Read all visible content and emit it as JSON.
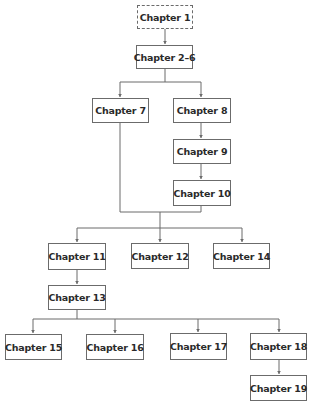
{
  "diagram": {
    "type": "flowchart",
    "colors": {
      "border": "#6b6b6b",
      "text": "#2a2a2a",
      "edge": "#6b6b6b",
      "background": "#ffffff"
    },
    "nodes": [
      {
        "id": "ch1",
        "label": "Chapter 1",
        "style": "dashed",
        "x": 137,
        "y": 5,
        "w": 56,
        "h": 24
      },
      {
        "id": "ch2_6",
        "label": "Chapter 2–6",
        "style": "solid",
        "x": 136,
        "y": 45,
        "w": 57,
        "h": 24
      },
      {
        "id": "ch7",
        "label": "Chapter 7",
        "style": "solid",
        "x": 92,
        "y": 98,
        "w": 57,
        "h": 25
      },
      {
        "id": "ch8",
        "label": "Chapter 8",
        "style": "solid",
        "x": 173,
        "y": 98,
        "w": 58,
        "h": 25
      },
      {
        "id": "ch9",
        "label": "Chapter 9",
        "style": "solid",
        "x": 173,
        "y": 139,
        "w": 58,
        "h": 25
      },
      {
        "id": "ch10",
        "label": "Chapter 10",
        "style": "solid",
        "x": 173,
        "y": 180,
        "w": 58,
        "h": 26
      },
      {
        "id": "ch11",
        "label": "Chapter 11",
        "style": "solid",
        "x": 48,
        "y": 243,
        "w": 58,
        "h": 27
      },
      {
        "id": "ch12",
        "label": "Chapter 12",
        "style": "solid",
        "x": 131,
        "y": 243,
        "w": 58,
        "h": 26
      },
      {
        "id": "ch14",
        "label": "Chapter 14",
        "style": "solid",
        "x": 213,
        "y": 243,
        "w": 57,
        "h": 26
      },
      {
        "id": "ch13",
        "label": "Chapter 13",
        "style": "solid",
        "x": 48,
        "y": 285,
        "w": 58,
        "h": 25
      },
      {
        "id": "ch15",
        "label": "Chapter 15",
        "style": "solid",
        "x": 5,
        "y": 334,
        "w": 57,
        "h": 26
      },
      {
        "id": "ch16",
        "label": "Chapter 16",
        "style": "solid",
        "x": 86,
        "y": 334,
        "w": 58,
        "h": 26
      },
      {
        "id": "ch17",
        "label": "Chapter 17",
        "style": "solid",
        "x": 170,
        "y": 333,
        "w": 57,
        "h": 27
      },
      {
        "id": "ch18",
        "label": "Chapter 18",
        "style": "solid",
        "x": 250,
        "y": 333,
        "w": 57,
        "h": 27
      },
      {
        "id": "ch19",
        "label": "Chapter 19",
        "style": "solid",
        "x": 250,
        "y": 375,
        "w": 57,
        "h": 26
      }
    ],
    "edges": [
      {
        "from": "ch1",
        "to": "ch2_6"
      },
      {
        "from": "ch2_6",
        "to": "ch7"
      },
      {
        "from": "ch2_6",
        "to": "ch8"
      },
      {
        "from": "ch8",
        "to": "ch9"
      },
      {
        "from": "ch9",
        "to": "ch10"
      },
      {
        "from": "ch7",
        "to": "ch11"
      },
      {
        "from": "ch7",
        "to": "ch12"
      },
      {
        "from": "ch7",
        "to": "ch14"
      },
      {
        "from": "ch10",
        "to": "ch11"
      },
      {
        "from": "ch10",
        "to": "ch12"
      },
      {
        "from": "ch10",
        "to": "ch14"
      },
      {
        "from": "ch11",
        "to": "ch13"
      },
      {
        "from": "ch13",
        "to": "ch15"
      },
      {
        "from": "ch13",
        "to": "ch16"
      },
      {
        "from": "ch13",
        "to": "ch17"
      },
      {
        "from": "ch13",
        "to": "ch18"
      },
      {
        "from": "ch18",
        "to": "ch19"
      }
    ],
    "paths": [
      "M165 29 L165 44",
      "M165 69 L165 82 M120 82 L201 82 M120 82 L120 97 M201 82 L201 97",
      "M201 123 L201 138",
      "M201 164 L201 179",
      "M120 123 L120 212 L201 212 L201 206",
      "M160 212 L160 228 M77 228 L242 228 M77 228 L77 242 M160 228 L160 242 M242 228 L242 242",
      "M77 270 L77 284",
      "M77 310 L77 319 M33 319 L279 319 M33 319 L33 333 M115 319 L115 333 M198 319 L198 332 M279 319 L279 332",
      "M279 360 L279 374"
    ],
    "arrowheads": [
      [
        165,
        44
      ],
      [
        120,
        97
      ],
      [
        201,
        97
      ],
      [
        201,
        138
      ],
      [
        201,
        179
      ],
      [
        77,
        242
      ],
      [
        160,
        242
      ],
      [
        242,
        242
      ],
      [
        77,
        284
      ],
      [
        33,
        333
      ],
      [
        115,
        333
      ],
      [
        198,
        332
      ],
      [
        279,
        332
      ],
      [
        279,
        374
      ]
    ]
  }
}
